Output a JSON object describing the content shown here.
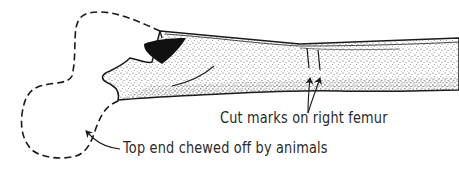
{
  "diagram": {
    "labels": {
      "cut_marks": "Cut marks on right femur",
      "chewed_end": "Top end chewed off by animals"
    },
    "colors": {
      "ink": "#1a1a1a",
      "stipple": "#555555",
      "background": "#ffffff",
      "cavity_fill": "#111111"
    },
    "elements": [
      {
        "name": "femur-shaft",
        "style": "stippled solid outline"
      },
      {
        "name": "missing-head-outline",
        "style": "dashed outline"
      },
      {
        "name": "dark-cavity",
        "style": "solid black fill"
      },
      {
        "name": "cut-marks",
        "count": 2
      },
      {
        "name": "arrow-cut-marks",
        "count": 2
      },
      {
        "name": "arrow-chewed-end",
        "count": 1
      }
    ]
  }
}
